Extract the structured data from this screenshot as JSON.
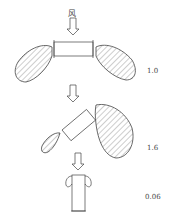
{
  "diagram": {
    "wind_label": "风",
    "stages": [
      {
        "name": "horizontal-plate",
        "value": "1.0"
      },
      {
        "name": "tilted-plate",
        "value": "1.6"
      },
      {
        "name": "vertical-plate",
        "value": "0.06"
      }
    ],
    "colors": {
      "stroke": "#444444",
      "background": "#ffffff"
    }
  }
}
